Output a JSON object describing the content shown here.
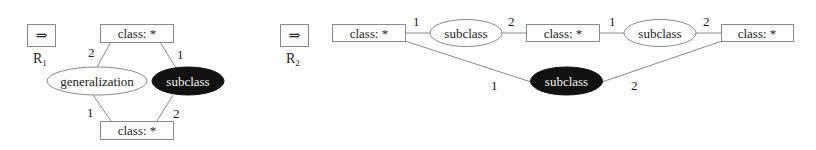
{
  "rules": [
    {
      "id": "R1",
      "arrow_icon": "double-right-arrow-icon",
      "arrow_glyph": "⇒",
      "label_main": "R",
      "label_sub": "1",
      "nodes": {
        "class_top": "class: *",
        "generalization": "generalization",
        "subclass_dark": "subclass",
        "class_bottom": "class: *"
      },
      "edge_labels": {
        "top_to_generalization": "2",
        "top_to_subclass": "1",
        "generalization_to_bottom": "1",
        "subclass_to_bottom": "2"
      }
    },
    {
      "id": "R2",
      "arrow_icon": "double-right-arrow-icon",
      "arrow_glyph": "⇒",
      "label_main": "R",
      "label_sub": "2",
      "nodes": {
        "class_a": "class: *",
        "subclass_1": "subclass",
        "class_b": "class: *",
        "subclass_2": "subclass",
        "class_c": "class: *",
        "subclass_dark": "subclass"
      },
      "edge_labels": {
        "a_to_subclass_1": "1",
        "subclass_1_to_b": "2",
        "b_to_subclass_2": "1",
        "subclass_2_to_c": "2",
        "a_to_subclass_dark": "1",
        "subclass_dark_to_c": "2"
      }
    }
  ],
  "colors": {
    "stroke": "#8a8a8a",
    "dark_fill": "#111111",
    "dark_text": "#f2f2f2",
    "text": "#222222"
  }
}
